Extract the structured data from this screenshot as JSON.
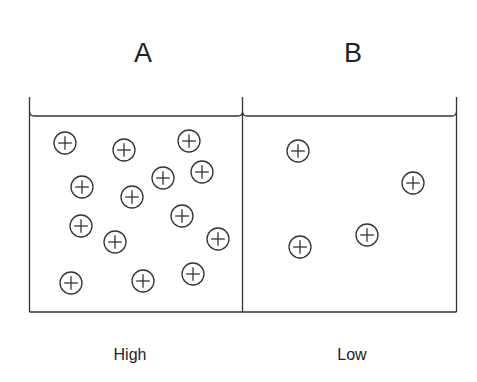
{
  "diagram": {
    "stroke_color": "#333333",
    "compartments": [
      {
        "id": "A",
        "title": "A",
        "concentration_label": "High",
        "title_x": 143,
        "label_x": 130,
        "ions": [
          [
            65,
            143
          ],
          [
            124,
            150
          ],
          [
            189,
            141
          ],
          [
            82,
            187
          ],
          [
            132,
            197
          ],
          [
            163,
            178
          ],
          [
            202,
            172
          ],
          [
            81,
            226
          ],
          [
            115,
            242
          ],
          [
            182,
            216
          ],
          [
            218,
            239
          ],
          [
            71,
            283
          ],
          [
            143,
            281
          ],
          [
            193,
            274
          ]
        ]
      },
      {
        "id": "B",
        "title": "B",
        "concentration_label": "Low",
        "title_x": 353,
        "label_x": 352,
        "ions": [
          [
            298,
            151
          ],
          [
            413,
            183
          ],
          [
            367,
            235
          ],
          [
            300,
            247
          ]
        ]
      }
    ],
    "ion_symbol": "positive-ion",
    "ion_radius": 11
  }
}
